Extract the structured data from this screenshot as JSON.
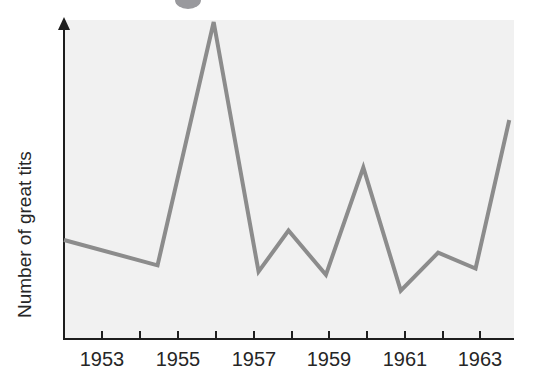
{
  "figure": {
    "background_color": "#ffffff",
    "plot_panel_color": "#f1f1f1",
    "axis_color": "#1d1d1d",
    "series_color": "#8c8c8c",
    "artifact_color": "#8e8e92",
    "artifact_name": "cropped-circle-artifact"
  },
  "chart_data": {
    "type": "line",
    "title": "",
    "subtitle": "",
    "xlabel": "",
    "ylabel": "Number of great tits",
    "grid": false,
    "legend": null,
    "legend_position": "none",
    "x_axis": {
      "tick_labels": [
        "1953",
        "1955",
        "1957",
        "1959",
        "1961",
        "1963"
      ],
      "labelled_tick_years": [
        1953,
        1955,
        1957,
        1959,
        1961,
        1963
      ],
      "all_tick_years": [
        1952,
        1953,
        1954,
        1955,
        1956,
        1957,
        1958,
        1959,
        1960,
        1961,
        1962,
        1963,
        1964
      ],
      "has_arrow": false,
      "range_years": [
        1952,
        1964
      ]
    },
    "y_axis": {
      "tick_labels": [],
      "has_arrow": true,
      "ylim": [
        0,
        100
      ],
      "unlabelled": true
    },
    "x": [
      1952,
      1954.5,
      1956,
      1957.2,
      1958,
      1959,
      1960,
      1961,
      1962,
      1963,
      1963.9
    ],
    "values": [
      31,
      23,
      100,
      21,
      34,
      20,
      54,
      15,
      27,
      22,
      69
    ],
    "series": [
      {
        "name": "Number of great tits",
        "x": [
          1952,
          1954.5,
          1956,
          1957.2,
          1958,
          1959,
          1960,
          1961,
          1962,
          1963,
          1963.9
        ],
        "values": [
          31,
          23,
          100,
          21,
          34,
          20,
          54,
          15,
          27,
          22,
          69
        ]
      }
    ],
    "annotations": []
  }
}
